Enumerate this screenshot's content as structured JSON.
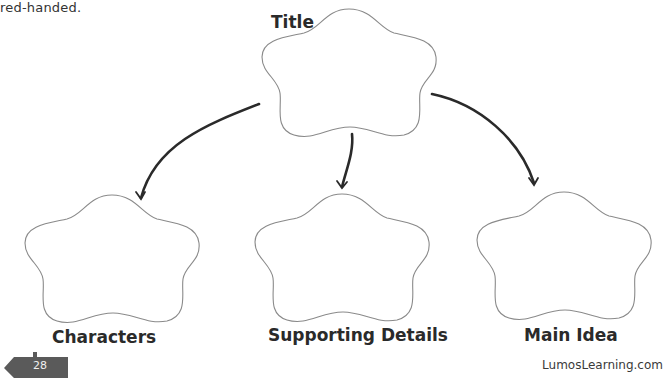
{
  "intro_text": "red-handed.",
  "organizer": {
    "top": {
      "label": "Title"
    },
    "bottom": [
      {
        "label": "Characters"
      },
      {
        "label": "Supporting Details"
      },
      {
        "label": "Main Idea"
      }
    ],
    "arrows": [
      "title-to-characters",
      "title-to-supporting-details",
      "title-to-main-idea"
    ]
  },
  "footer": {
    "page_number": "28",
    "brand": "LumosLearning.com"
  },
  "colors": {
    "outline": "#8a8a8a",
    "arrow": "#2a2a2a",
    "page_tag": "#5a5a5a"
  }
}
